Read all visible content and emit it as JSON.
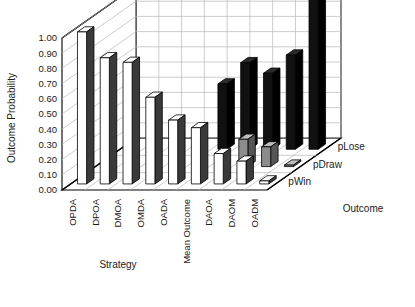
{
  "chart_data": {
    "type": "bar",
    "title": "",
    "subtitle": "",
    "projection": "3d-grouped-bar",
    "xlabel": "Strategy",
    "ylabel": "Outcome Probability",
    "zlabel": "Outcome",
    "categories": [
      "OPDA",
      "DPOA",
      "DMOA",
      "OMDA",
      "OADA",
      "Mean Outcome",
      "DAOA",
      "DAOM",
      "OADM"
    ],
    "series": [
      {
        "name": "pWin",
        "color": "#ffffff",
        "values": [
          1.0,
          0.83,
          0.8,
          0.57,
          0.42,
          0.37,
          0.2,
          0.15,
          0.02
        ]
      },
      {
        "name": "pDraw",
        "color": "#8c8c8c",
        "values": [
          0.0,
          0.0,
          0.0,
          0.0,
          0.0,
          0.0,
          0.18,
          0.13,
          0.01
        ]
      },
      {
        "name": "pLose",
        "color": "#111111",
        "values": [
          0.0,
          0.0,
          0.0,
          0.0,
          0.43,
          0.57,
          0.5,
          0.62,
          1.0
        ]
      }
    ],
    "ylim": [
      0.0,
      1.0
    ],
    "ytick_values": [
      "1.00",
      "0.90",
      "0.80",
      "0.70",
      "0.60",
      "0.50",
      "0.40",
      "0.30",
      "0.20",
      "0.10",
      "0.00"
    ],
    "grid": true,
    "legend": "depth-axis",
    "legend_position": "right"
  },
  "axes": {
    "y_title": "Outcome Probability",
    "x_title": "Strategy",
    "z_title": "Outcome"
  },
  "series_labels": {
    "top": "pLose",
    "middle": "pDraw",
    "bottom": "pWin"
  },
  "colors": {
    "pWin": "#ffffff",
    "pDraw": "#8c8c8c",
    "pLose": "#111111",
    "frame": "#000000",
    "grid": "#b8b8b8",
    "floor": "#ffffff",
    "wall": "#ffffff",
    "text": "#1a1a1a"
  }
}
